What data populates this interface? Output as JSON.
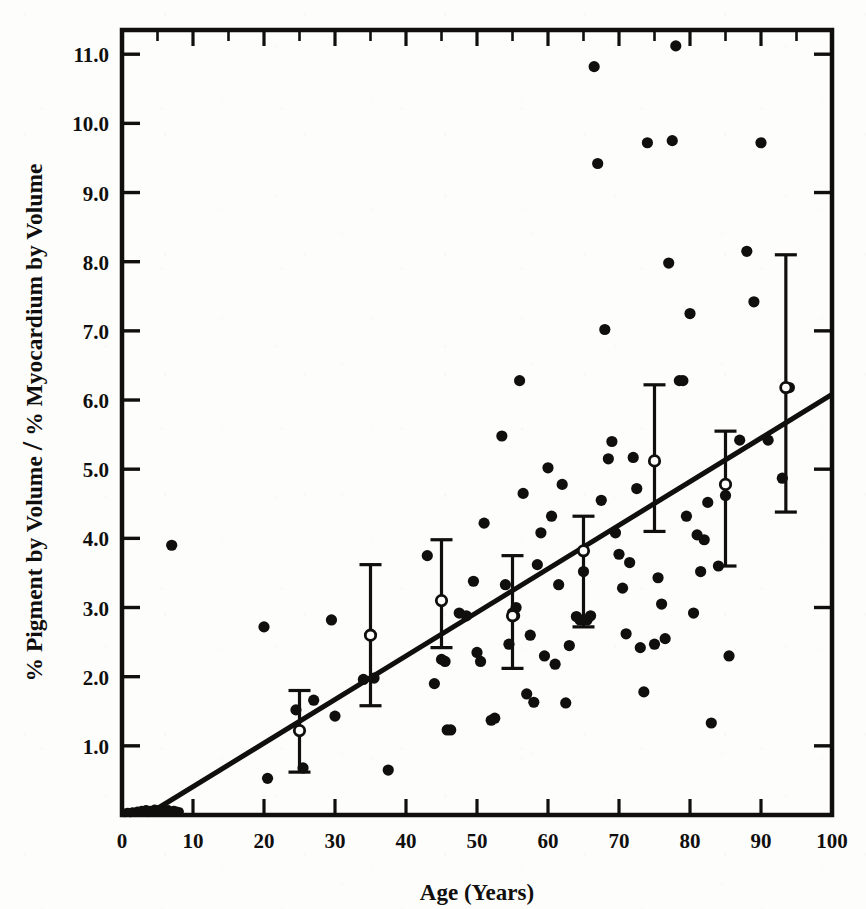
{
  "figure": {
    "title_y_axis": "% Pigment by Volume",
    "title_y_axis_2": "% Myocardium by Volume",
    "y_axis_separator": "/",
    "title_x_axis": "Age (Years)",
    "ink_color": "#100f0e",
    "paper_color": "#fdfdfc"
  },
  "chart_data": {
    "type": "scatter",
    "title": "",
    "xlabel": "Age (Years)",
    "ylabel": "% Pigment by Volume / % Myocardium by Volume",
    "xlim": [
      0,
      100
    ],
    "ylim": [
      0,
      11.35
    ],
    "xticks": [
      0,
      10,
      20,
      30,
      40,
      50,
      60,
      70,
      80,
      90,
      100
    ],
    "xticklabels": [
      "0",
      "10",
      "20",
      "30",
      "40",
      "50",
      "60",
      "70",
      "80",
      "90",
      "100"
    ],
    "yticks": [
      1.0,
      2.0,
      3.0,
      4.0,
      5.0,
      6.0,
      7.0,
      8.0,
      9.0,
      10.0,
      11.0
    ],
    "yticklabels": [
      "1.0",
      "2.0",
      "3.0",
      "4.0",
      "5.0",
      "6.0",
      "7.0",
      "8.0",
      "9.0",
      "10.0",
      "11.0"
    ],
    "grid": false,
    "legend": "none",
    "frame": "full-box-with-ticks-all-sides",
    "series": [
      {
        "name": "Individual subjects",
        "marker": "filled-circle",
        "color": "#100f0e",
        "points": [
          [
            0.4,
            0.03
          ],
          [
            0.8,
            0.04
          ],
          [
            1.2,
            0.03
          ],
          [
            1.5,
            0.05
          ],
          [
            1.9,
            0.04
          ],
          [
            2.2,
            0.06
          ],
          [
            2.5,
            0.05
          ],
          [
            2.8,
            0.07
          ],
          [
            3.1,
            0.05
          ],
          [
            3.4,
            0.08
          ],
          [
            3.7,
            0.06
          ],
          [
            4.0,
            0.07
          ],
          [
            4.3,
            0.05
          ],
          [
            4.6,
            0.09
          ],
          [
            4.9,
            0.06
          ],
          [
            5.2,
            0.08
          ],
          [
            5.5,
            0.05
          ],
          [
            5.8,
            0.07
          ],
          [
            6.1,
            0.06
          ],
          [
            6.5,
            0.08
          ],
          [
            6.9,
            0.05
          ],
          [
            7.3,
            0.07
          ],
          [
            7.7,
            0.06
          ],
          [
            8.1,
            0.05
          ],
          [
            7.0,
            3.9
          ],
          [
            20.0,
            2.72
          ],
          [
            20.5,
            0.53
          ],
          [
            24.5,
            1.52
          ],
          [
            25.5,
            0.68
          ],
          [
            27.0,
            1.66
          ],
          [
            29.5,
            2.82
          ],
          [
            30.0,
            1.43
          ],
          [
            34.0,
            1.96
          ],
          [
            35.5,
            1.98
          ],
          [
            37.5,
            0.65
          ],
          [
            43.0,
            3.75
          ],
          [
            44.0,
            1.9
          ],
          [
            45.0,
            2.25
          ],
          [
            45.5,
            2.22
          ],
          [
            45.8,
            1.23
          ],
          [
            46.3,
            1.23
          ],
          [
            47.5,
            2.92
          ],
          [
            48.5,
            2.88
          ],
          [
            49.5,
            3.38
          ],
          [
            50.0,
            2.35
          ],
          [
            50.5,
            2.22
          ],
          [
            51.0,
            4.22
          ],
          [
            52.0,
            1.37
          ],
          [
            52.5,
            1.4
          ],
          [
            53.5,
            5.48
          ],
          [
            54.0,
            3.33
          ],
          [
            54.5,
            2.47
          ],
          [
            55.0,
            2.92
          ],
          [
            55.3,
            2.88
          ],
          [
            55.5,
            3.0
          ],
          [
            56.0,
            6.28
          ],
          [
            56.5,
            4.65
          ],
          [
            57.0,
            1.75
          ],
          [
            57.5,
            2.6
          ],
          [
            58.0,
            1.63
          ],
          [
            58.5,
            3.62
          ],
          [
            59.0,
            4.08
          ],
          [
            59.5,
            2.3
          ],
          [
            60.0,
            5.02
          ],
          [
            60.5,
            4.32
          ],
          [
            61.0,
            2.18
          ],
          [
            61.5,
            3.33
          ],
          [
            62.0,
            4.78
          ],
          [
            62.5,
            1.62
          ],
          [
            63.0,
            2.45
          ],
          [
            64.0,
            2.87
          ],
          [
            64.5,
            2.82
          ],
          [
            65.0,
            3.52
          ],
          [
            65.5,
            2.82
          ],
          [
            66.0,
            2.88
          ],
          [
            66.5,
            10.82
          ],
          [
            67.0,
            9.42
          ],
          [
            67.5,
            4.55
          ],
          [
            68.0,
            7.02
          ],
          [
            68.5,
            5.15
          ],
          [
            69.0,
            5.4
          ],
          [
            69.5,
            4.08
          ],
          [
            70.0,
            3.77
          ],
          [
            70.5,
            3.28
          ],
          [
            71.0,
            2.62
          ],
          [
            71.5,
            3.65
          ],
          [
            72.0,
            5.17
          ],
          [
            72.5,
            4.72
          ],
          [
            73.0,
            2.42
          ],
          [
            73.5,
            1.78
          ],
          [
            74.0,
            9.72
          ],
          [
            75.0,
            2.47
          ],
          [
            75.5,
            3.43
          ],
          [
            76.0,
            3.05
          ],
          [
            76.5,
            2.55
          ],
          [
            77.0,
            7.98
          ],
          [
            77.5,
            9.75
          ],
          [
            78.0,
            11.12
          ],
          [
            78.5,
            6.28
          ],
          [
            79.0,
            6.28
          ],
          [
            79.5,
            4.32
          ],
          [
            80.0,
            7.25
          ],
          [
            80.5,
            2.92
          ],
          [
            81.0,
            4.05
          ],
          [
            81.5,
            3.52
          ],
          [
            82.0,
            3.98
          ],
          [
            82.5,
            4.52
          ],
          [
            83.0,
            1.33
          ],
          [
            84.0,
            3.6
          ],
          [
            85.0,
            4.62
          ],
          [
            85.5,
            2.3
          ],
          [
            87.0,
            5.42
          ],
          [
            88.0,
            8.15
          ],
          [
            89.0,
            7.42
          ],
          [
            90.0,
            9.72
          ],
          [
            91.0,
            5.42
          ],
          [
            93.0,
            4.87
          ],
          [
            94.0,
            6.18
          ]
        ]
      },
      {
        "name": "Decade means with range bars",
        "marker": "open-circle-with-error-bar",
        "color": "#100f0e",
        "points": [
          {
            "x": 25,
            "mean": 1.22,
            "low": 0.62,
            "high": 1.8
          },
          {
            "x": 35,
            "mean": 2.6,
            "low": 1.58,
            "high": 3.62
          },
          {
            "x": 45,
            "mean": 3.1,
            "low": 2.42,
            "high": 3.98
          },
          {
            "x": 55,
            "mean": 2.88,
            "low": 2.12,
            "high": 3.75
          },
          {
            "x": 65,
            "mean": 3.82,
            "low": 2.72,
            "high": 4.32
          },
          {
            "x": 75,
            "mean": 5.12,
            "low": 4.1,
            "high": 6.22
          },
          {
            "x": 85,
            "mean": 4.78,
            "low": 3.6,
            "high": 5.55
          },
          {
            "x": 93.5,
            "mean": 6.18,
            "low": 4.38,
            "high": 8.1
          }
        ]
      }
    ],
    "trend_line": {
      "name": "Regression line",
      "type": "linear",
      "x_start": 3.5,
      "y_start": 0.0,
      "x_end": 100.0,
      "y_end": 6.08,
      "color": "#100f0e",
      "width": 5
    }
  }
}
